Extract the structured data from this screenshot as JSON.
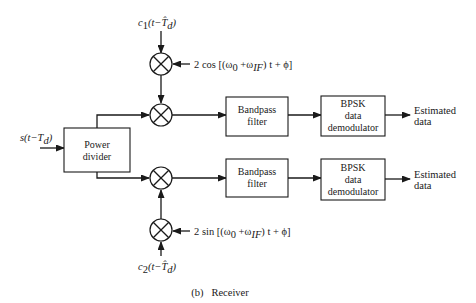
{
  "diagram": {
    "caption": "(b)   Receiver",
    "inputs": {
      "received_signal": "s(t−T",
      "received_signal_sub": "d",
      "received_signal_close": ")",
      "code1_prefix": "c",
      "code1_sub": "1",
      "code1_rest": "(t−T̂",
      "code1_rest_sub": "d",
      "code1_close": ")",
      "code2_prefix": "c",
      "code2_sub": "2",
      "code2_rest": "(t−T̂",
      "code2_rest_sub": "d",
      "code2_close": ")"
    },
    "local_oscillators": {
      "cos_ref": "2 cos [(ω",
      "cos_sub0": "0",
      "cos_mid": " +ω",
      "cos_subIF": "IF",
      "cos_end": ") t + ϕ]",
      "sin_ref": "2 sin [(ω",
      "sin_sub0": "0",
      "sin_mid": " +ω",
      "sin_subIF": "IF",
      "sin_end": ") t + ϕ]"
    },
    "blocks": {
      "power_divider": [
        "Power",
        "divider"
      ],
      "bandpass_filter_top": [
        "Bandpass",
        "filter"
      ],
      "bandpass_filter_bottom": [
        "Bandpass",
        "filter"
      ],
      "bpsk_top": [
        "BPSK",
        "data",
        "demodulator"
      ],
      "bpsk_bottom": [
        "BPSK",
        "data",
        "demodulator"
      ]
    },
    "outputs": {
      "top": [
        "Estimated",
        "data"
      ],
      "bottom": [
        "Estimated",
        "data"
      ]
    },
    "mixer_symbol": "multiplier"
  }
}
